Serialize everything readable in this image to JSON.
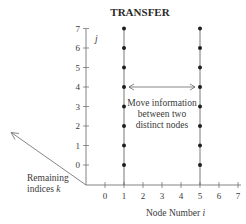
{
  "title": "TRANSFER",
  "y_axis": {
    "label": "j",
    "ticks": [
      "0",
      "1",
      "2",
      "3",
      "4",
      "5",
      "6",
      "7"
    ]
  },
  "x_axis": {
    "label": "Node Number i",
    "label_plain": "Node Number ",
    "label_var": "i",
    "ticks": [
      "0",
      "1",
      "2",
      "3",
      "4",
      "5",
      "6",
      "7"
    ]
  },
  "depth_axis": {
    "label_line1": "Remaining",
    "label_line2_plain": "indices ",
    "label_line2_var": "k"
  },
  "annotation": {
    "line1": "Move information",
    "line2": "between two",
    "line3": "distinct nodes"
  },
  "diagram": {
    "active_nodes": [
      1,
      5
    ],
    "dot_levels": [
      0,
      1,
      2,
      3,
      4,
      5,
      6,
      7
    ],
    "transfer_level": 4,
    "colors": {
      "ink": "#2a2a2a",
      "axis": "#555555",
      "background": "#ffffff"
    }
  }
}
